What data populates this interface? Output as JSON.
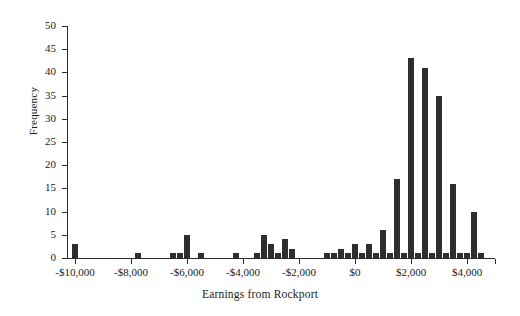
{
  "chart_data": {
    "type": "bar",
    "title": "",
    "xlabel": "Earnings from Rockport",
    "ylabel": "Frequency",
    "xlim": [
      -10250,
      5000
    ],
    "ylim": [
      0,
      50
    ],
    "grid": false,
    "legend": null,
    "bin_width": 250,
    "xticks": [
      -10000,
      -8000,
      -6000,
      -4000,
      -2000,
      0,
      2000,
      4000
    ],
    "xtick_labels": [
      "-$10,000",
      "-$8,000",
      "-$6,000",
      "-$4,000",
      "-$2,000",
      "$0",
      "$2,000",
      "$4,000"
    ],
    "yticks": [
      0,
      5,
      10,
      15,
      20,
      25,
      30,
      35,
      40,
      45,
      50
    ],
    "ytick_labels": [
      "0",
      "5",
      "10",
      "15",
      "20",
      "25",
      "30",
      "35",
      "40",
      "45",
      "50"
    ],
    "categories": [
      -10000,
      -7750,
      -6500,
      -6250,
      -6000,
      -5500,
      -4250,
      -3500,
      -3250,
      -3000,
      -2750,
      -2500,
      -2250,
      -1000,
      -750,
      -500,
      -250,
      0,
      250,
      500,
      750,
      1000,
      1250,
      1500,
      1750,
      2000,
      2250,
      2500,
      2750,
      3000,
      3250,
      3500,
      3750,
      4000,
      4250,
      4500
    ],
    "values": [
      3,
      1,
      1,
      1,
      5,
      1,
      1,
      1,
      5,
      3,
      1,
      4,
      2,
      1,
      1,
      2,
      1,
      3,
      1,
      3,
      1,
      6,
      1,
      17,
      1,
      43,
      1,
      41,
      1,
      35,
      1,
      16,
      1,
      1,
      10,
      1
    ],
    "bars": [
      {
        "x": -10000,
        "y": 3
      },
      {
        "x": -7750,
        "y": 1
      },
      {
        "x": -6500,
        "y": 1
      },
      {
        "x": -6250,
        "y": 1
      },
      {
        "x": -6000,
        "y": 5
      },
      {
        "x": -5500,
        "y": 1
      },
      {
        "x": -4250,
        "y": 1
      },
      {
        "x": -3500,
        "y": 1
      },
      {
        "x": -3250,
        "y": 5
      },
      {
        "x": -3000,
        "y": 3
      },
      {
        "x": -2750,
        "y": 1
      },
      {
        "x": -2500,
        "y": 4
      },
      {
        "x": -2250,
        "y": 2
      },
      {
        "x": -1000,
        "y": 1
      },
      {
        "x": -750,
        "y": 1
      },
      {
        "x": -500,
        "y": 2
      },
      {
        "x": -250,
        "y": 1
      },
      {
        "x": 0,
        "y": 3
      },
      {
        "x": 250,
        "y": 1
      },
      {
        "x": 500,
        "y": 3
      },
      {
        "x": 750,
        "y": 1
      },
      {
        "x": 1000,
        "y": 6
      },
      {
        "x": 1250,
        "y": 1
      },
      {
        "x": 1500,
        "y": 17
      },
      {
        "x": 1750,
        "y": 1
      },
      {
        "x": 2000,
        "y": 43
      },
      {
        "x": 2250,
        "y": 1
      },
      {
        "x": 2500,
        "y": 41
      },
      {
        "x": 2750,
        "y": 1
      },
      {
        "x": 3000,
        "y": 35
      },
      {
        "x": 3250,
        "y": 1
      },
      {
        "x": 3500,
        "y": 16
      },
      {
        "x": 3750,
        "y": 1
      },
      {
        "x": 4000,
        "y": 1
      },
      {
        "x": 4250,
        "y": 10
      },
      {
        "x": 4500,
        "y": 1
      }
    ],
    "bar_color": "#2e2e2e",
    "axis_color": "#2a2a2a"
  }
}
